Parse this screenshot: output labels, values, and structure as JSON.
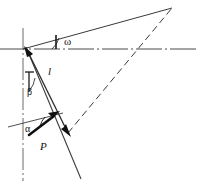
{
  "figure": {
    "background_color": "#ffffff",
    "stroke_color": "#2b2b2b",
    "bold_stroke_color": "#111111",
    "labels": {
      "omega": "ω",
      "l": "l",
      "beta": "β",
      "alpha": "α",
      "P": "P"
    },
    "elements": {
      "horizontal_axis": "horizontal-reference-line",
      "vertical_axis": "vertical-centerline",
      "upper_ray": "upper-inclined-ray",
      "dashed_ray": "dashed-diagonal-ray",
      "member_line": "inclined-member-line",
      "length_arrow": "length-dimension-arrow",
      "force_arrow": "force-vector-arrow",
      "alpha_baseline": "alpha-reference-line",
      "omega_arc": "omega-angle-tick",
      "beta_tick": "beta-angle-tick"
    }
  }
}
